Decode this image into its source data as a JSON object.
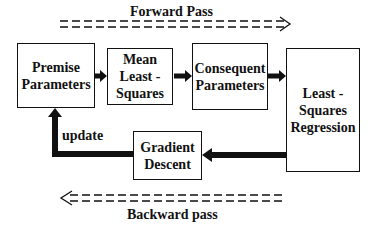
{
  "diagram": {
    "forward_label": "Forward Pass",
    "backward_label": "Backward pass",
    "update_label": "update",
    "boxes": {
      "premise": [
        "Premise",
        "Parameters"
      ],
      "mean": [
        "Mean",
        "Least -",
        "Squares"
      ],
      "consequent": [
        "Consequent",
        "Parameters"
      ],
      "lsr": [
        "Least -",
        "Squares",
        "Regression"
      ],
      "gradient": [
        "Gradient",
        "Descent"
      ]
    },
    "edges": [
      {
        "from": "Premise Parameters",
        "to": "Mean Least-Squares"
      },
      {
        "from": "Mean Least-Squares",
        "to": "Consequent Parameters"
      },
      {
        "from": "Consequent Parameters",
        "to": "Least-Squares Regression"
      },
      {
        "from": "Least-Squares Regression",
        "to": "Gradient Descent"
      },
      {
        "from": "Gradient Descent",
        "to": "Premise Parameters",
        "label": "update"
      }
    ]
  }
}
